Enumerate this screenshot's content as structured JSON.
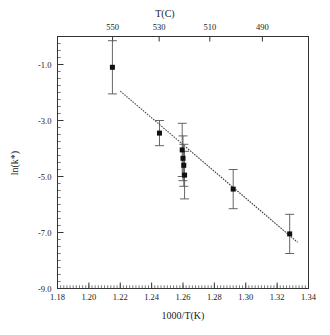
{
  "chart_data": {
    "type": "scatter",
    "title": "",
    "xlabel": "1000/T(K)",
    "ylabel": "ln(k*)",
    "top_axis_label": "T(C)",
    "xlim": [
      1.18,
      1.34
    ],
    "ylim": [
      -9.0,
      0.0
    ],
    "grid": false,
    "legend": false,
    "x_ticks": [
      "1.18",
      "1.20",
      "1.22",
      "1.24",
      "1.26",
      "1.28",
      "1.30",
      "1.32",
      "1.34"
    ],
    "x_tick_values": [
      1.18,
      1.2,
      1.22,
      1.24,
      1.26,
      1.28,
      1.3,
      1.32,
      1.34
    ],
    "y_ticks": [
      "-1.0",
      "-3.0",
      "-5.0",
      "-7.0",
      "-9.0"
    ],
    "y_tick_values": [
      -1.0,
      -3.0,
      -5.0,
      -7.0,
      -9.0
    ],
    "top_ticks": [
      "550",
      "530",
      "510",
      "490"
    ],
    "top_tick_values": [
      1.2151,
      1.2448,
      1.2771,
      1.3106
    ],
    "marker": "filled-square",
    "marker_color": "#111111",
    "errorbar_color": "#555555",
    "line_color": "#444444",
    "points": [
      {
        "x": 1.215,
        "y": -1.1,
        "yerr": 0.95
      },
      {
        "x": 1.245,
        "y": -3.45,
        "yerr": 0.45
      },
      {
        "x": 1.2595,
        "y": -4.05,
        "yerr": 0.95
      },
      {
        "x": 1.26,
        "y": -4.35,
        "yerr": 0.8
      },
      {
        "x": 1.2605,
        "y": -4.6,
        "yerr": 0.75
      },
      {
        "x": 1.261,
        "y": -4.95,
        "yerr": 0.85
      },
      {
        "x": 1.292,
        "y": -5.45,
        "yerr": 0.7
      },
      {
        "x": 1.328,
        "y": -7.05,
        "yerr": 0.7
      }
    ],
    "fit_line": {
      "x1": 1.22,
      "y1": -1.95,
      "x2": 1.333,
      "y2": -7.35
    }
  },
  "axes": {
    "top_title": "T(C)",
    "bottom_title": "1000/T(K)",
    "left_title": "ln(k*)"
  }
}
